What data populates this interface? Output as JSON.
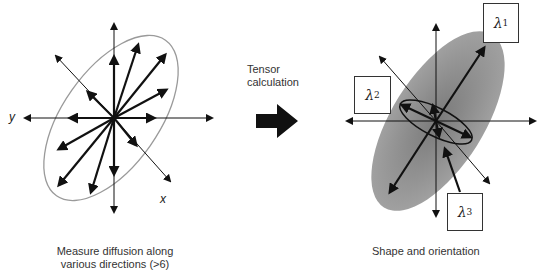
{
  "left_panel": {
    "axis_labels": {
      "y": "y",
      "x": "x"
    },
    "caption_line1": "Measure diffusion along",
    "caption_line2": "various directions (>6)"
  },
  "middle": {
    "label_line1": "Tensor",
    "label_line2": "calculation",
    "arrow": "right-arrow-icon"
  },
  "right_panel": {
    "eigenvalues": [
      {
        "symbol": "λ",
        "sub": "1"
      },
      {
        "symbol": "λ",
        "sub": "2"
      },
      {
        "symbol": "λ",
        "sub": "3"
      }
    ],
    "caption": "Shape and orientation"
  },
  "colors": {
    "ellipse_outline": "#9a9a9a",
    "ellipsoid_fill": "#8c8c8c",
    "arrow": "#111111"
  }
}
